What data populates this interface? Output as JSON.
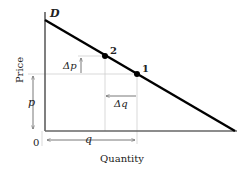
{
  "diagram": {
    "curve_label": "D",
    "y_axis_label": "Price",
    "x_axis_label": "Quantity",
    "origin_label": "0",
    "price_label": "p",
    "quantity_label": "q",
    "delta_p_label": "Δp",
    "delta_q_label": "Δq",
    "points": [
      {
        "id": "point-1",
        "label": "1"
      },
      {
        "id": "point-2",
        "label": "2"
      }
    ],
    "colors": {
      "curve": "#000000",
      "axis": "#444444",
      "guide": "#cccccc",
      "text": "#222222"
    }
  }
}
